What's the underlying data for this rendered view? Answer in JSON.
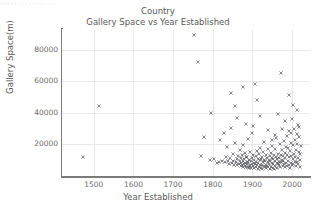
{
  "figure": {
    "background": "#ffffff",
    "top_artifact_text": "····· ··· ··· ··"
  },
  "chart_data": {
    "type": "scatter",
    "title": "Country",
    "subtitle": "Gallery Space vs Year Established",
    "xlabel": "Year Established",
    "ylabel": "Gallery Space(m)",
    "grid": true,
    "legend": null,
    "marker": "x",
    "marker_color": "#5e5e66",
    "xlim": [
      1420,
      2045
    ],
    "ylim": [
      0,
      93000
    ],
    "xticks": [
      1500,
      1600,
      1700,
      1800,
      1900,
      2000
    ],
    "yticks": [
      20000,
      40000,
      60000,
      80000
    ],
    "points": [
      [
        1472,
        11800
      ],
      [
        1512,
        44000
      ],
      [
        1753,
        89500
      ],
      [
        1764,
        72000
      ],
      [
        1771,
        12500
      ],
      [
        1778,
        24500
      ],
      [
        1793,
        10200
      ],
      [
        1802,
        11000
      ],
      [
        1810,
        8500
      ],
      [
        1816,
        9000
      ],
      [
        1819,
        23000
      ],
      [
        1824,
        9500
      ],
      [
        1830,
        8700
      ],
      [
        1833,
        12000
      ],
      [
        1836,
        18500
      ],
      [
        1839,
        9200
      ],
      [
        1841,
        7800
      ],
      [
        1843,
        11500
      ],
      [
        1845,
        30500
      ],
      [
        1848,
        8200
      ],
      [
        1850,
        14000
      ],
      [
        1852,
        9800
      ],
      [
        1854,
        7200
      ],
      [
        1856,
        21000
      ],
      [
        1858,
        8800
      ],
      [
        1860,
        36500
      ],
      [
        1861,
        10500
      ],
      [
        1862,
        6800
      ],
      [
        1864,
        12800
      ],
      [
        1866,
        7500
      ],
      [
        1868,
        9300
      ],
      [
        1869,
        16500
      ],
      [
        1870,
        6200
      ],
      [
        1871,
        11200
      ],
      [
        1872,
        8000
      ],
      [
        1873,
        13500
      ],
      [
        1874,
        7000
      ],
      [
        1875,
        19500
      ],
      [
        1876,
        9600
      ],
      [
        1877,
        5800
      ],
      [
        1878,
        10800
      ],
      [
        1879,
        7600
      ],
      [
        1880,
        14500
      ],
      [
        1881,
        6500
      ],
      [
        1882,
        8400
      ],
      [
        1883,
        11800
      ],
      [
        1884,
        5400
      ],
      [
        1885,
        9100
      ],
      [
        1886,
        7300
      ],
      [
        1887,
        12300
      ],
      [
        1888,
        6000
      ],
      [
        1889,
        23500
      ],
      [
        1890,
        8600
      ],
      [
        1891,
        5200
      ],
      [
        1892,
        10100
      ],
      [
        1893,
        7100
      ],
      [
        1894,
        15500
      ],
      [
        1895,
        6400
      ],
      [
        1896,
        9400
      ],
      [
        1897,
        4800
      ],
      [
        1898,
        11400
      ],
      [
        1899,
        7800
      ],
      [
        1900,
        27000
      ],
      [
        1901,
        6100
      ],
      [
        1902,
        13200
      ],
      [
        1903,
        8300
      ],
      [
        1904,
        5000
      ],
      [
        1905,
        10400
      ],
      [
        1906,
        58500
      ],
      [
        1907,
        7400
      ],
      [
        1908,
        12600
      ],
      [
        1909,
        5600
      ],
      [
        1910,
        9000
      ],
      [
        1911,
        16000
      ],
      [
        1912,
        6700
      ],
      [
        1913,
        11000
      ],
      [
        1914,
        4600
      ],
      [
        1915,
        8100
      ],
      [
        1916,
        13800
      ],
      [
        1917,
        5900
      ],
      [
        1918,
        9900
      ],
      [
        1919,
        7000
      ],
      [
        1920,
        18000
      ],
      [
        1921,
        5300
      ],
      [
        1922,
        10700
      ],
      [
        1923,
        6900
      ],
      [
        1924,
        12100
      ],
      [
        1925,
        4400
      ],
      [
        1926,
        8800
      ],
      [
        1927,
        15000
      ],
      [
        1928,
        6300
      ],
      [
        1929,
        10000
      ],
      [
        1930,
        21500
      ],
      [
        1931,
        5700
      ],
      [
        1932,
        9700
      ],
      [
        1933,
        7200
      ],
      [
        1934,
        13000
      ],
      [
        1935,
        4900
      ],
      [
        1936,
        11600
      ],
      [
        1937,
        6600
      ],
      [
        1938,
        8900
      ],
      [
        1939,
        17000
      ],
      [
        1940,
        5500
      ],
      [
        1941,
        10300
      ],
      [
        1942,
        7700
      ],
      [
        1943,
        12900
      ],
      [
        1944,
        4200
      ],
      [
        1945,
        9200
      ],
      [
        1946,
        14800
      ],
      [
        1947,
        6000
      ],
      [
        1948,
        11300
      ],
      [
        1949,
        8000
      ],
      [
        1950,
        19000
      ],
      [
        1951,
        5100
      ],
      [
        1952,
        10900
      ],
      [
        1953,
        7500
      ],
      [
        1954,
        13600
      ],
      [
        1955,
        4700
      ],
      [
        1956,
        9500
      ],
      [
        1957,
        16800
      ],
      [
        1958,
        6200
      ],
      [
        1959,
        12000
      ],
      [
        1960,
        24000
      ],
      [
        1961,
        8400
      ],
      [
        1962,
        5000
      ],
      [
        1963,
        10600
      ],
      [
        1964,
        7300
      ],
      [
        1965,
        14200
      ],
      [
        1966,
        6800
      ],
      [
        1967,
        11700
      ],
      [
        1968,
        9100
      ],
      [
        1969,
        20000
      ],
      [
        1970,
        5800
      ],
      [
        1971,
        13400
      ],
      [
        1972,
        8700
      ],
      [
        1973,
        65000
      ],
      [
        1974,
        10200
      ],
      [
        1975,
        16200
      ],
      [
        1976,
        6400
      ],
      [
        1977,
        12400
      ],
      [
        1978,
        9800
      ],
      [
        1979,
        22000
      ],
      [
        1980,
        7600
      ],
      [
        1981,
        14600
      ],
      [
        1982,
        5600
      ],
      [
        1983,
        11100
      ],
      [
        1984,
        18500
      ],
      [
        1985,
        8500
      ],
      [
        1986,
        25500
      ],
      [
        1987,
        6100
      ],
      [
        1988,
        13100
      ],
      [
        1989,
        9400
      ],
      [
        1990,
        17500
      ],
      [
        1991,
        7000
      ],
      [
        1992,
        11900
      ],
      [
        1993,
        28500
      ],
      [
        1994,
        5300
      ],
      [
        1995,
        15800
      ],
      [
        1996,
        8200
      ],
      [
        1997,
        21000
      ],
      [
        1998,
        12700
      ],
      [
        1999,
        6700
      ],
      [
        2000,
        36000
      ],
      [
        2001,
        10500
      ],
      [
        2002,
        19500
      ],
      [
        2003,
        7900
      ],
      [
        2004,
        14000
      ],
      [
        2005,
        30000
      ],
      [
        2006,
        9000
      ],
      [
        2007,
        23000
      ],
      [
        2008,
        12200
      ],
      [
        2009,
        6500
      ],
      [
        2010,
        16500
      ],
      [
        2011,
        26500
      ],
      [
        2012,
        8800
      ],
      [
        2013,
        20500
      ],
      [
        2014,
        11500
      ],
      [
        2015,
        32000
      ],
      [
        2016,
        7400
      ],
      [
        2017,
        15200
      ],
      [
        2018,
        24500
      ],
      [
        2019,
        10000
      ],
      [
        2020,
        5500
      ],
      [
        2021,
        13800
      ],
      [
        2022,
        18800
      ],
      [
        1796,
        40000
      ],
      [
        1829,
        27500
      ],
      [
        1857,
        44500
      ],
      [
        1884,
        33000
      ],
      [
        1911,
        48000
      ],
      [
        1938,
        29000
      ],
      [
        1965,
        39500
      ],
      [
        1992,
        51000
      ],
      [
        2011,
        41500
      ],
      [
        1847,
        52500
      ],
      [
        1902,
        31500
      ],
      [
        1956,
        26000
      ],
      [
        1981,
        34500
      ],
      [
        2003,
        45000
      ],
      [
        1875,
        56000
      ],
      [
        1920,
        38000
      ],
      [
        1949,
        22500
      ],
      [
        1974,
        29500
      ],
      [
        1997,
        27000
      ],
      [
        2018,
        31000
      ]
    ]
  }
}
